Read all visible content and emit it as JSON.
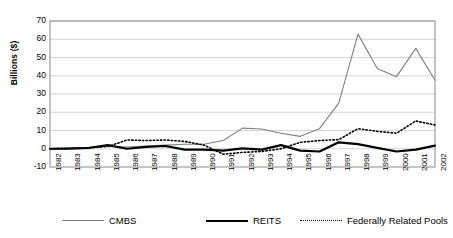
{
  "chart_data": {
    "type": "line",
    "title": "",
    "xlabel": "",
    "ylabel": "Billions ($)",
    "ylim": [
      -10,
      70
    ],
    "yticks": [
      -10,
      0,
      10,
      20,
      30,
      40,
      50,
      60,
      70
    ],
    "grid": true,
    "legend_position": "bottom",
    "categories": [
      "1982",
      "1983",
      "1984",
      "1985",
      "1986",
      "1987",
      "1988",
      "1989",
      "1990",
      "1991",
      "1992",
      "1993",
      "1994",
      "1995",
      "1996",
      "1997",
      "1998",
      "1999",
      "2000",
      "2001",
      "2002"
    ],
    "series": [
      {
        "name": "CMBS",
        "style": "solid-thin",
        "color": "#7f7f7f",
        "values": [
          0.0,
          0.2,
          0.5,
          1.5,
          1.0,
          1.5,
          2.0,
          2.5,
          2.5,
          4.5,
          11.3,
          10.8,
          8.5,
          6.8,
          11.0,
          25.0,
          62.8,
          44.0,
          39.5,
          55.0,
          37.5
        ]
      },
      {
        "name": "REITS",
        "style": "solid-thick",
        "color": "#000000",
        "values": [
          0.0,
          0.1,
          0.4,
          2.0,
          0.0,
          1.0,
          1.5,
          -0.5,
          -0.5,
          -1.0,
          0.2,
          -0.5,
          2.0,
          -1.0,
          -1.5,
          3.5,
          2.5,
          0.5,
          -1.5,
          -0.5,
          1.7
        ]
      },
      {
        "name": "Federally Related Pools",
        "style": "dotted",
        "color": "#000000",
        "values": [
          0.0,
          0.2,
          0.6,
          1.2,
          4.8,
          4.5,
          4.8,
          4.0,
          2.0,
          -3.0,
          -2.0,
          -1.5,
          0.0,
          3.5,
          4.5,
          5.0,
          11.0,
          9.5,
          8.5,
          15.2,
          13.0
        ]
      }
    ]
  },
  "legend": {
    "items": [
      {
        "label": "CMBS",
        "swatch": "thin-gray-line"
      },
      {
        "label": "REITS",
        "swatch": "thick-black-line"
      },
      {
        "label": "Federally Related Pools",
        "swatch": "black-dotted-line"
      }
    ]
  }
}
